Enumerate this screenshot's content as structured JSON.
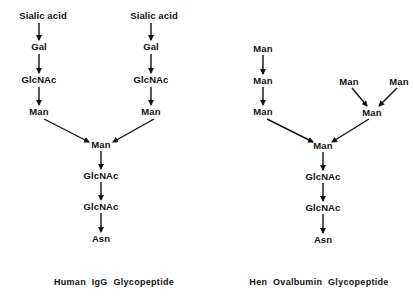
{
  "diagrams": [
    {
      "caption": "Human IgG Glycopeptide",
      "caption_pos": [
        114,
        282
      ],
      "nodes": [
        {
          "id": "l_sia",
          "label": "Sialic acid",
          "x": 43,
          "y": 16
        },
        {
          "id": "l_gal",
          "label": "Gal",
          "x": 39,
          "y": 47
        },
        {
          "id": "l_glcnac",
          "label": "GlcNAc",
          "x": 39,
          "y": 80
        },
        {
          "id": "l_man",
          "label": "Man",
          "x": 39,
          "y": 112
        },
        {
          "id": "r_sia",
          "label": "Sialic acid",
          "x": 154,
          "y": 16
        },
        {
          "id": "r_gal",
          "label": "Gal",
          "x": 151,
          "y": 47
        },
        {
          "id": "r_glcnac",
          "label": "GlcNAc",
          "x": 151,
          "y": 80
        },
        {
          "id": "r_man",
          "label": "Man",
          "x": 151,
          "y": 112
        },
        {
          "id": "c_man",
          "label": "Man",
          "x": 101,
          "y": 145
        },
        {
          "id": "c_glcnac1",
          "label": "GlcNAc",
          "x": 101,
          "y": 176
        },
        {
          "id": "c_glcnac2",
          "label": "GlcNAc",
          "x": 101,
          "y": 207
        },
        {
          "id": "c_asn",
          "label": "Asn",
          "x": 101,
          "y": 239
        }
      ],
      "edges": [
        [
          39,
          23,
          39,
          40
        ],
        [
          39,
          54,
          39,
          73
        ],
        [
          39,
          87,
          39,
          105
        ],
        [
          44,
          119,
          89,
          142
        ],
        [
          151,
          23,
          151,
          40
        ],
        [
          151,
          54,
          151,
          73
        ],
        [
          151,
          87,
          151,
          105
        ],
        [
          154,
          119,
          113,
          142
        ],
        [
          101,
          151,
          101,
          169
        ],
        [
          101,
          182,
          101,
          200
        ],
        [
          101,
          213,
          101,
          232
        ]
      ]
    },
    {
      "caption": "Hen Ovalbumin Glycopeptide",
      "caption_pos": [
        319,
        282
      ],
      "nodes": [
        {
          "id": "a_man1",
          "label": "Man",
          "x": 263,
          "y": 49
        },
        {
          "id": "a_man2",
          "label": "Man",
          "x": 263,
          "y": 81
        },
        {
          "id": "a_man3",
          "label": "Man",
          "x": 263,
          "y": 112
        },
        {
          "id": "b_man1",
          "label": "Man",
          "x": 349,
          "y": 82
        },
        {
          "id": "b_man2",
          "label": "Man",
          "x": 399,
          "y": 82
        },
        {
          "id": "b_man3",
          "label": "Man",
          "x": 372,
          "y": 113
        },
        {
          "id": "c_man",
          "label": "Man",
          "x": 323,
          "y": 146
        },
        {
          "id": "c_glcnac1",
          "label": "GlcNAc",
          "x": 323,
          "y": 177
        },
        {
          "id": "c_glcnac2",
          "label": "GlcNAc",
          "x": 323,
          "y": 208
        },
        {
          "id": "c_asn",
          "label": "Asn",
          "x": 323,
          "y": 240
        }
      ],
      "edges": [
        [
          263,
          55,
          263,
          74
        ],
        [
          263,
          87,
          263,
          105
        ],
        [
          267,
          119,
          313,
          142
        ],
        [
          352,
          88,
          367,
          106
        ],
        [
          397,
          88,
          379,
          106
        ],
        [
          369,
          119,
          332,
          142
        ],
        [
          323,
          152,
          323,
          170
        ],
        [
          323,
          183,
          323,
          201
        ],
        [
          323,
          214,
          323,
          233
        ]
      ]
    }
  ],
  "colors": {
    "ink": "#111111",
    "background": "#ffffff"
  }
}
